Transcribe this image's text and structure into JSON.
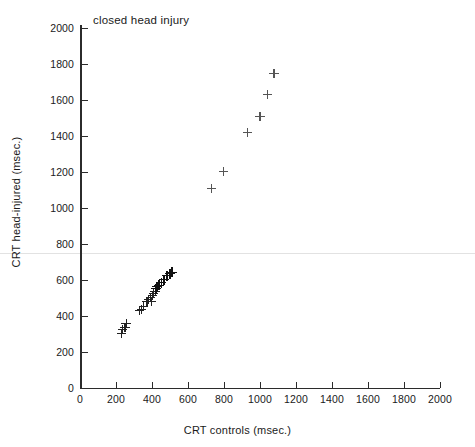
{
  "chart_data": {
    "type": "scatter",
    "title": "closed head injury",
    "xlabel": "CRT controls (msec.)",
    "ylabel": "CRT head-injured (msec.)",
    "xlim": [
      0,
      2000
    ],
    "ylim": [
      0,
      2000
    ],
    "xticks": [
      0,
      200,
      400,
      600,
      800,
      1000,
      1200,
      1400,
      1600,
      1800,
      2000
    ],
    "yticks": [
      0,
      200,
      400,
      600,
      800,
      1000,
      1200,
      1400,
      1600,
      1800,
      2000
    ],
    "xtick_labels": [
      "0",
      "200",
      "400",
      "600",
      "800",
      "1000",
      "1200",
      "1400",
      "1600",
      "1800",
      "2000"
    ],
    "ytick_labels": [
      "0",
      "200",
      "400",
      "600",
      "800",
      "1000",
      "1200",
      "1400",
      "1600",
      "1800",
      "2000"
    ],
    "grid": false,
    "legend": null,
    "marker": "plus",
    "marker_color": "#222222",
    "axis_color": "#2b2b2b",
    "series": [
      {
        "name": "subjects",
        "points": [
          [
            230,
            300
          ],
          [
            238,
            322
          ],
          [
            250,
            333
          ],
          [
            256,
            355
          ],
          [
            330,
            428
          ],
          [
            342,
            433
          ],
          [
            352,
            450
          ],
          [
            372,
            478
          ],
          [
            381,
            489
          ],
          [
            393,
            500
          ],
          [
            399,
            478
          ],
          [
            405,
            511
          ],
          [
            410,
            522
          ],
          [
            417,
            533
          ],
          [
            422,
            550
          ],
          [
            428,
            561
          ],
          [
            440,
            567
          ],
          [
            452,
            583
          ],
          [
            468,
            600
          ],
          [
            483,
            622
          ],
          [
            500,
            633
          ],
          [
            512,
            639
          ],
          [
            730,
            1106
          ],
          [
            795,
            1200
          ],
          [
            930,
            1417
          ],
          [
            1000,
            1506
          ],
          [
            1040,
            1628
          ],
          [
            1078,
            1744
          ]
        ]
      }
    ]
  }
}
